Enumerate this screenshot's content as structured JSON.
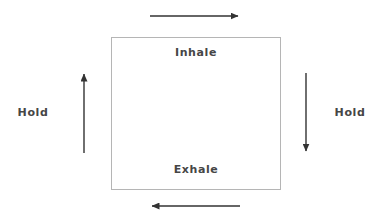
{
  "diagram": {
    "type": "box-breathing",
    "background_color": "#ffffff",
    "box": {
      "stroke_color": "#b5b5b5",
      "fill_color": "#ffffff",
      "x": 111,
      "y": 37,
      "width": 170,
      "height": 153
    },
    "text_color": "#464646",
    "arrow_color": "#333333",
    "labels": {
      "inhale": "Inhale",
      "exhale": "Exhale",
      "hold_left": "Hold",
      "hold_right": "Hold"
    },
    "arrows": [
      {
        "name": "top-arrow-right",
        "direction": "right",
        "meaning": "Inhale",
        "x1": 150,
        "y1": 16,
        "x2": 238,
        "y2": 16
      },
      {
        "name": "right-arrow-down",
        "direction": "down",
        "meaning": "Hold",
        "x1": 306,
        "y1": 73,
        "x2": 306,
        "y2": 151
      },
      {
        "name": "bottom-arrow-left",
        "direction": "left",
        "meaning": "Exhale",
        "x1": 240,
        "y1": 206,
        "x2": 152,
        "y2": 206
      },
      {
        "name": "left-arrow-up",
        "direction": "up",
        "meaning": "Hold",
        "x1": 84,
        "y1": 153,
        "x2": 84,
        "y2": 74
      }
    ]
  }
}
